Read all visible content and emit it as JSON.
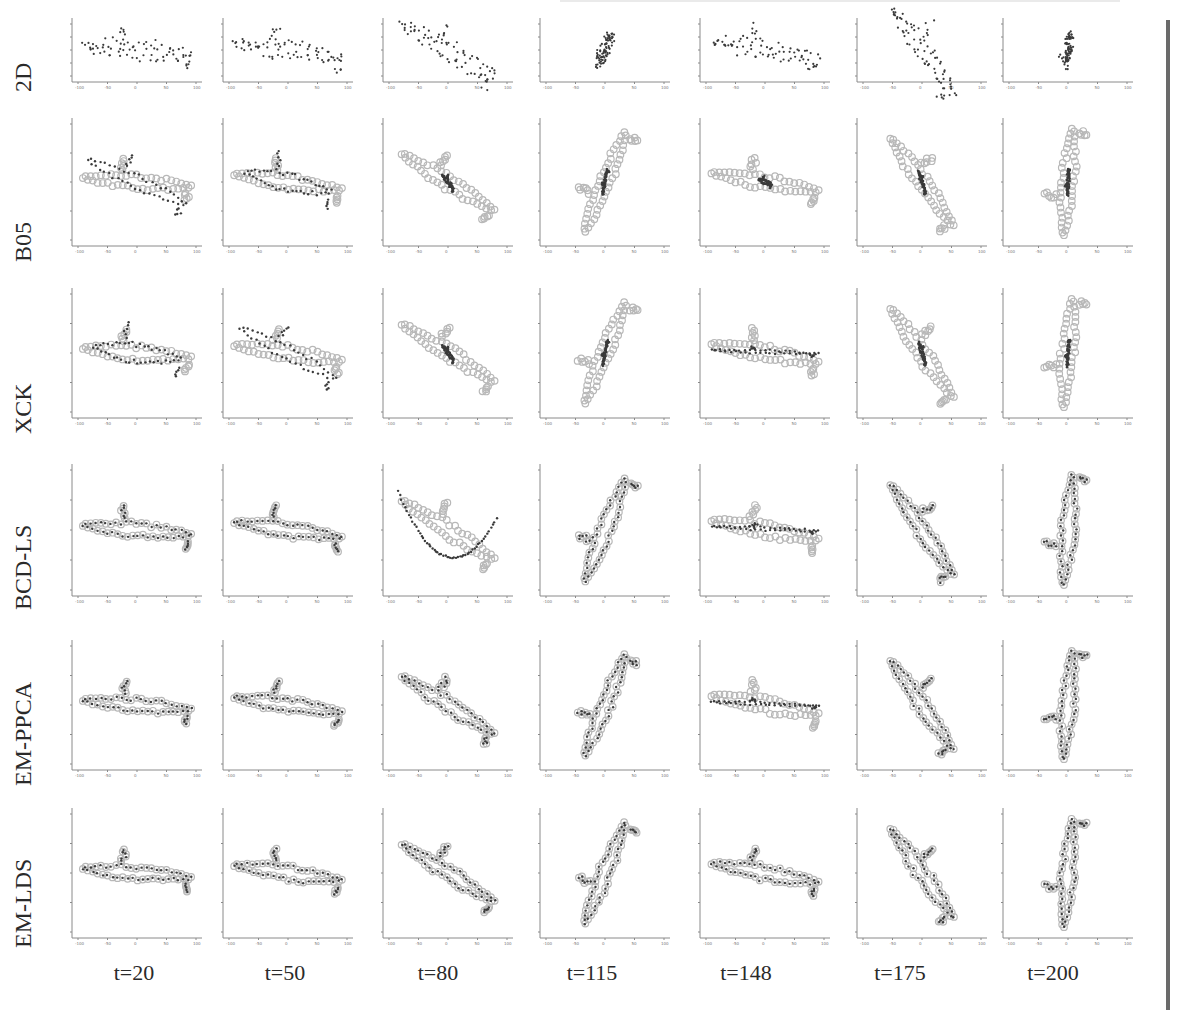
{
  "figure": {
    "row_labels": [
      "2D",
      "B05",
      "XCK",
      "BCD-LS",
      "EM-PPCA",
      "EM-LDS"
    ],
    "col_labels": [
      "t=20",
      "t=50",
      "t=80",
      "t=115",
      "t=148",
      "t=175",
      "t=200"
    ],
    "tick_labels": [
      "-100",
      "-50",
      "0",
      "50",
      "100"
    ],
    "colors": {
      "ground_truth_marker": "#b8b8b8",
      "estimate_marker": "#3a3a3a",
      "axis": "#8a8a8a",
      "right_bar": "#6a6a6a"
    }
  },
  "chart_data": {
    "type": "scatter",
    "title": "",
    "layout": "grid 6 rows x 7 columns of small scatter plots",
    "rows": [
      "2D",
      "B05",
      "XCK",
      "BCD-LS",
      "EM-PPCA",
      "EM-LDS"
    ],
    "columns": [
      "t=20",
      "t=50",
      "t=80",
      "t=115",
      "t=148",
      "t=175",
      "t=200"
    ],
    "xlim": [
      -100,
      100
    ],
    "ylim": [
      -100,
      100
    ],
    "xticks": [
      -100,
      -50,
      0,
      50,
      100
    ],
    "yticks": [
      -100,
      -50,
      0,
      50,
      100
    ],
    "grid": false,
    "legend": null,
    "series_description": {
      "ground_truth": "light gray open circles (reconstructed 3D shape, shown in rows B05..EM-LDS)",
      "estimate": "dark filled dots (method reconstruction; in row 2D the observed 2D points)"
    },
    "shape_orientation_deg": {
      "t=20": -5,
      "t=50": -8,
      "t=80": -32,
      "t=115": 68,
      "t=148": -10,
      "t=175": -55,
      "t=200": 85
    },
    "panels": {
      "2D": {
        "t=20": "spread",
        "t=50": "spread",
        "t=80": "spread",
        "t=115": "compact",
        "t=148": "spread",
        "t=175": "spread",
        "t=200": "compact"
      },
      "B05": {
        "t=20": "misaligned",
        "t=50": "partial",
        "t=80": "collapsed",
        "t=115": "collapsed",
        "t=148": "collapsed",
        "t=175": "collapsed",
        "t=200": "collapsed"
      },
      "XCK": {
        "t=20": "partial",
        "t=50": "misaligned",
        "t=80": "collapsed",
        "t=115": "collapsed",
        "t=148": "flat",
        "t=175": "collapsed",
        "t=200": "collapsed"
      },
      "BCD-LS": {
        "t=20": "good",
        "t=50": "good",
        "t=80": "diverged",
        "t=115": "good",
        "t=148": "flat",
        "t=175": "good",
        "t=200": "good"
      },
      "EM-PPCA": {
        "t=20": "good",
        "t=50": "good",
        "t=80": "good",
        "t=115": "good",
        "t=148": "flat",
        "t=175": "good",
        "t=200": "good"
      },
      "EM-LDS": {
        "t=20": "good",
        "t=50": "good",
        "t=80": "good",
        "t=115": "good",
        "t=148": "good",
        "t=175": "good",
        "t=200": "good"
      }
    }
  }
}
